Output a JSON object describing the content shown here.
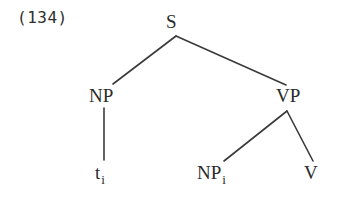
{
  "figure": {
    "example_number": "(134)",
    "caption": "",
    "background_color": "#ffffff",
    "line_color": "#3a3a3a",
    "text_color": "#2b2b2b"
  },
  "tree": {
    "nodes": {
      "root": {
        "label": "S"
      },
      "np_subject": {
        "label": "NP"
      },
      "vp": {
        "label": "VP"
      },
      "trace": {
        "label": "t",
        "subscript": "i"
      },
      "np_object": {
        "label": "NP",
        "subscript": "i"
      },
      "verb": {
        "label": "V"
      }
    }
  }
}
